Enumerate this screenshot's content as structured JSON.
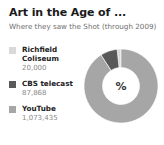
{
  "header": {
    "title": "Art in the Age of ...",
    "subtitle": "Where they saw the Shot (through 2009)"
  },
  "center_label": "%",
  "legend": {
    "items": [
      {
        "label": "Richfield Coliseum",
        "value": "20,000",
        "color": "#d9d9d9"
      },
      {
        "label": "CBS telecast",
        "value": "87,868",
        "color": "#595959"
      },
      {
        "label": "YouTube",
        "value": "1,073,435",
        "color": "#a6a6a6"
      }
    ]
  },
  "chart_data": {
    "type": "pie",
    "variant": "donut",
    "title": "Art in the Age of ...",
    "subtitle": "Where they saw the Shot (through 2009)",
    "xlabel": "",
    "ylabel": "",
    "units": "viewers",
    "center_label": "%",
    "legend_position": "left",
    "grid": false,
    "start_angle_deg": 0,
    "direction": "counterclockwise",
    "inner_radius_ratio": 0.5,
    "categories": [
      "Richfield Coliseum",
      "CBS telecast",
      "YouTube"
    ],
    "values": [
      20000,
      87868,
      1073435
    ],
    "percents": [
      1.7,
      7.4,
      90.9
    ],
    "colors": [
      "#d9d9d9",
      "#595959",
      "#a6a6a6"
    ],
    "total": 1181303
  }
}
